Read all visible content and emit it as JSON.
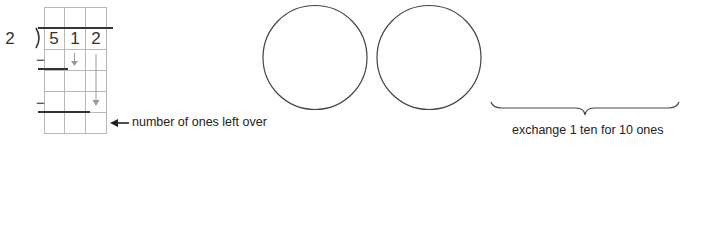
{
  "division": {
    "divisor": "2",
    "dividend_digits": [
      "5",
      "1",
      "2"
    ],
    "minus_signs": [
      "−",
      "−"
    ]
  },
  "annotations": {
    "remainder_label": "number of ones left over",
    "exchange_label": "exchange 1 ten for 10 ones"
  },
  "icons": {
    "remainder_arrow": "left-arrow-icon",
    "bring_down_arrow_1": "down-arrow-icon",
    "bring_down_arrow_2": "down-arrow-icon"
  },
  "place_value_circles": [
    {
      "label": ""
    },
    {
      "label": ""
    }
  ],
  "colors": {
    "grid": "#b8b8b8",
    "ink": "#333333",
    "arrow_gray": "#9a9a9a"
  }
}
